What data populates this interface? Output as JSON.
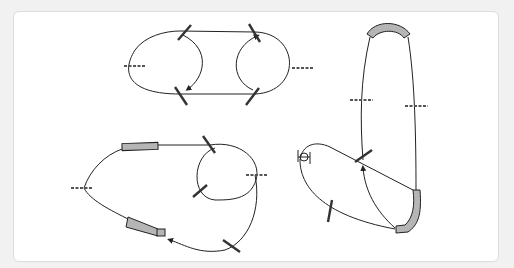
{
  "diagram": {
    "type": "beamline-schematics",
    "panels": [
      {
        "name": "racetrack-ring",
        "elements": [
          "two-semicircle-loop",
          "four-diagonal-kickers",
          "two-horizontal-markers",
          "injection-arc",
          "ejection-arc"
        ]
      },
      {
        "name": "teardrop-loop",
        "elements": [
          "straight-magnet",
          "tapered-magnet",
          "inner-circle",
          "markers",
          "direction-arrow"
        ]
      },
      {
        "name": "recirculating-loop",
        "elements": [
          "top-bend-arc",
          "bottom-bend-arc",
          "side-markers",
          "crossing-point",
          "source-symbol",
          "direction-arrow"
        ]
      }
    ],
    "colors": {
      "line": "#222222",
      "block": "#b5b5b5",
      "background": "#ffffff",
      "frame": "#f1f1f1"
    }
  }
}
